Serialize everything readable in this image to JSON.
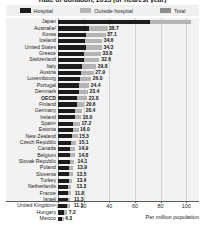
{
  "chart_data": {
    "type": "bar",
    "orientation": "horizontal",
    "stacked": true,
    "title": "Rate of donation, 2015 (or nearest year)",
    "xlabel": "Per million population",
    "ylabel": "",
    "xlim": [
      0,
      110
    ],
    "xticks": [
      0,
      20,
      40,
      60,
      80,
      100
    ],
    "grid": true,
    "legend_position": "top",
    "legend": [
      "Hospital",
      "Outside hospital",
      "Total"
    ],
    "colors": {
      "hospital": "#1c1c1c",
      "outside_hospital": "#b4b4b4",
      "total": "#8c8c8c",
      "plot_background": "#f2f2f2",
      "legend_background": "#f0f0f0"
    },
    "series": [
      {
        "name": "Hospital",
        "values": [
          72.0,
          24.0,
          22.0,
          21.0,
          21.5,
          20.0,
          20.0,
          19.0,
          18.0,
          17.0,
          16.5,
          16.0,
          15.0,
          14.5,
          13.5,
          13.0,
          12.0,
          11.5,
          11.0,
          10.0,
          9.5,
          9.2,
          9.0,
          8.8,
          8.5,
          8.2,
          8.0,
          7.8,
          7.5,
          7.2,
          5.0,
          3.0
        ]
      },
      {
        "name": "Outside hospital",
        "values": [
          32.0,
          14.7,
          15.1,
          13.6,
          12.8,
          13.6,
          12.0,
          10.8,
          9.9,
          9.0,
          7.9,
          7.4,
          7.6,
          6.1,
          5.2,
          5.0,
          5.2,
          4.5,
          4.3,
          4.1,
          3.9,
          3.7,
          3.3,
          3.1,
          3.4,
          2.8,
          2.5,
          2.0,
          1.9,
          1.8,
          2.2,
          1.3
        ]
      }
    ],
    "categories": [
      "Japan",
      "Australia²",
      "Korea",
      "Iceland",
      "United States",
      "Greece",
      "Switzerland",
      "Italy",
      "Austria",
      "Luxembourg",
      "Portugal",
      "Denmark",
      "OECD",
      "Finland",
      "Germany",
      "Ireland",
      "Spain¹",
      "Estonia",
      "New Zealand",
      "Czech Republic",
      "Canada",
      "Belgium",
      "Slovak Republic",
      "Poland",
      "Slovenia",
      "Turkey",
      "Netherlands",
      "France",
      "Israel",
      "United Kingdom¹",
      "Hungary",
      "Mexico"
    ],
    "totals": [
      104.0,
      38.7,
      37.1,
      34.6,
      34.3,
      33.6,
      32.6,
      29.8,
      27.9,
      26.0,
      24.4,
      23.4,
      22.8,
      20.6,
      20.4,
      18.0,
      17.2,
      16.0,
      15.3,
      15.1,
      14.9,
      14.8,
      14.1,
      13.9,
      13.5,
      13.4,
      13.3,
      11.8,
      11.3,
      11.1,
      7.2,
      4.3
    ],
    "value_labels": [
      "",
      "38.7",
      "37.1",
      "34.6",
      "34.3",
      "33.6",
      "32.6",
      "29.8",
      "27.9",
      "26.0",
      "24.4",
      "23.4",
      "22.8",
      "20.6",
      "20.4",
      "18.0",
      "17.2",
      "16.0",
      "15.3",
      "15.1",
      "14.9",
      "14.8",
      "14.1",
      "13.9",
      "13.5",
      "13.4",
      "13.3",
      "11.8",
      "11.3",
      "11.1",
      "7.2",
      "4.3"
    ]
  }
}
